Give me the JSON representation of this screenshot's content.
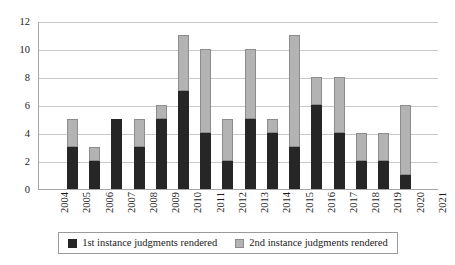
{
  "chart_data": {
    "type": "bar",
    "stacked": true,
    "title": "",
    "xlabel": "",
    "ylabel": "",
    "categories": [
      "2004",
      "2005",
      "2006",
      "2007",
      "2008",
      "2009",
      "2010",
      "2011",
      "2012",
      "2013",
      "2014",
      "2015",
      "2016",
      "2017",
      "2018",
      "2019",
      "2020",
      "2021"
    ],
    "series": [
      {
        "name": "1st instance judgments rendered",
        "color": "#262626",
        "values": [
          0,
          3,
          2,
          5,
          3,
          5,
          7,
          4,
          2,
          5,
          4,
          3,
          6,
          4,
          2,
          2,
          1,
          0
        ]
      },
      {
        "name": "2nd instance judgments rendered",
        "color": "#b3b3b3",
        "values": [
          0,
          2,
          1,
          0,
          2,
          1,
          4,
          6,
          3,
          5,
          1,
          8,
          2,
          4,
          2,
          2,
          5,
          0
        ]
      }
    ],
    "totals": [
      0,
      5,
      3,
      5,
      5,
      6,
      11,
      10,
      5,
      10,
      5,
      11,
      8,
      8,
      4,
      4,
      6,
      0
    ],
    "ylim": [
      0,
      12
    ],
    "yticks": [
      0,
      2,
      4,
      6,
      8,
      10,
      12
    ],
    "ytick_labels": [
      "0",
      "2",
      "4",
      "6",
      "8",
      "10",
      "12"
    ],
    "grid": true,
    "legend_position": "bottom"
  },
  "legend": {
    "entries": [
      {
        "label": "1st instance judgments rendered",
        "swatch": "first"
      },
      {
        "label": "2nd instance judgments rendered",
        "swatch": "second"
      }
    ]
  }
}
